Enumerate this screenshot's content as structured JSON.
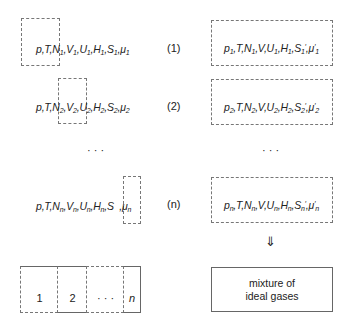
{
  "rows": [
    {
      "label": "(1)",
      "left_parts": [
        "p",
        ",",
        "T",
        ",",
        "N",
        "1",
        ",",
        "V",
        "1",
        ",",
        "U",
        "1",
        ",",
        "H",
        "1",
        ",",
        "S",
        "1",
        ",",
        "μ",
        "1"
      ],
      "left_text": "p,T,N1,V1,U1,H1,S1,μ1",
      "right_text": "p1,T,N1,V,U1,H1,S1′,μ′1"
    },
    {
      "label": "(2)",
      "left_text": "p,T,N2,V2,U2,H2,S2,μ2",
      "right_text": "p2,T,N2,V,U2,H2,S2′,μ′2"
    },
    {
      "label": "(n)",
      "left_text": "p,T,Nn,Vn,Un,Hn,S ,μn",
      "right_text": "pn,T,Nn,V,Un,Hn,Sn′,μ′n"
    }
  ],
  "ellipsis": "· · ·",
  "arrow": "⇓",
  "partition": {
    "cells": [
      "1",
      "2",
      "· · ·",
      "n"
    ]
  },
  "mixture_box": {
    "line1": "mixture of",
    "line2": "ideal gases"
  },
  "sym": {
    "p": "p",
    "T": "T",
    "N": "N",
    "V": "V",
    "U": "U",
    "H": "H",
    "S": "S",
    "mu": "μ",
    "s1": "1",
    "s2": "2",
    "sn": "n",
    "comma": ",",
    "prime": "′"
  }
}
